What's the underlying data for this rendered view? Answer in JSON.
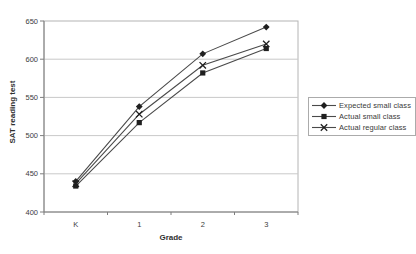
{
  "chart_data": {
    "type": "line",
    "title": "",
    "xlabel": "Grade",
    "ylabel": "SAT reading test",
    "categories": [
      "K",
      "1",
      "2",
      "3"
    ],
    "series": [
      {
        "name": "Expected small class",
        "marker": "diamond",
        "values": [
          440,
          538,
          607,
          642
        ]
      },
      {
        "name": "Actual small class",
        "marker": "square",
        "values": [
          434,
          517,
          582,
          614
        ]
      },
      {
        "name": "Actual regular class",
        "marker": "x",
        "values": [
          437,
          528,
          592,
          620
        ]
      }
    ],
    "ylim": [
      400,
      650
    ],
    "yticks": [
      400,
      450,
      500,
      550,
      600,
      650
    ],
    "grid": "horizontal",
    "legend_position": "right",
    "colors": {
      "line": "#4a4a4a",
      "marker": "#1f1f1f",
      "gridline": "#c9c9c9",
      "plot_border": "#b4b4b4",
      "axis": "#7e7e7e",
      "tick_text": "#3d3d3d",
      "background": "#ffffff"
    }
  }
}
